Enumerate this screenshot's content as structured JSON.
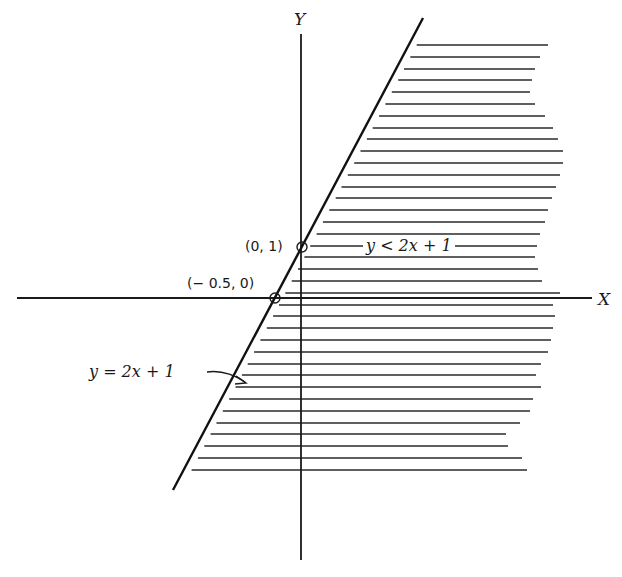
{
  "chart_data": {
    "type": "line",
    "title": "",
    "xlabel": "X",
    "ylabel": "Y",
    "grid": false,
    "boundary_line": {
      "equation": "y = 2x + 1",
      "slope": 2,
      "intercept": 1,
      "style": "solid"
    },
    "shaded_region": {
      "inequality": "y < 2x + 1",
      "side": "right/below the line",
      "pattern": "horizontal hatching"
    },
    "points": [
      {
        "label": "(0, 1)",
        "x": 0,
        "y": 1,
        "marker": "open-circle"
      },
      {
        "label": "(− 0.5, 0)",
        "x": -0.5,
        "y": 0,
        "marker": "open-circle"
      }
    ],
    "annotations": [
      {
        "text": "y = 2x + 1",
        "points_to": "boundary line",
        "arrow": true
      },
      {
        "text": "y < 2x + 1",
        "location": "inside shaded region"
      }
    ]
  },
  "labels": {
    "x_axis": "X",
    "y_axis": "Y",
    "point_a": "(0, 1)",
    "point_b": "(− 0.5, 0)",
    "inequality": "y < 2x + 1",
    "line_eq": "y = 2x + 1"
  },
  "colors": {
    "ink": "#1a1a1a",
    "background": "#ffffff"
  }
}
